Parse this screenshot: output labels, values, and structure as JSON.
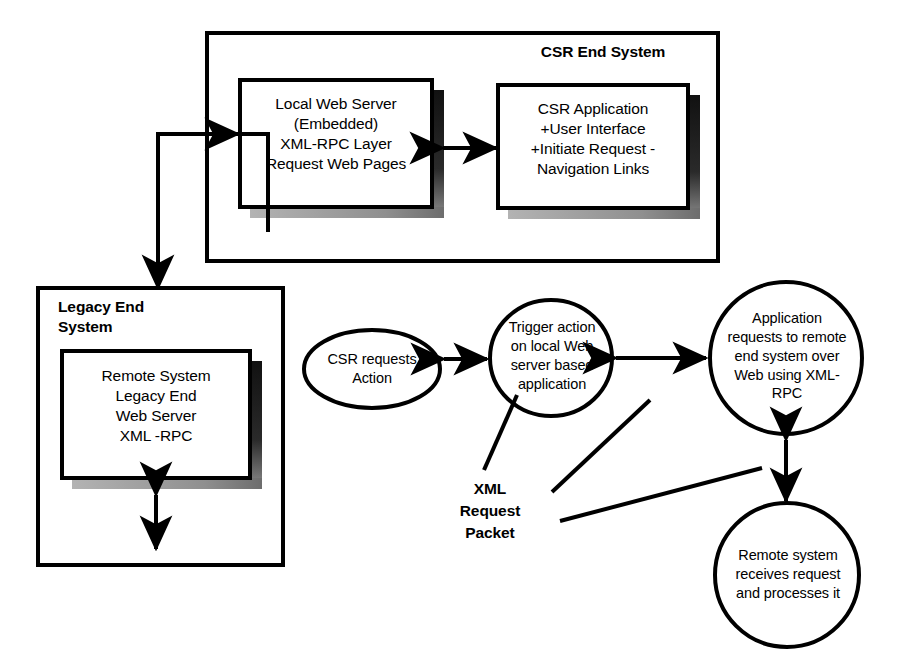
{
  "diagram": {
    "colors": {
      "stroke": "#000000",
      "fill": "#ffffff",
      "shadow_dark": "#1a1a1a",
      "shadow_light": "#9a9a9a"
    }
  },
  "csr_system": {
    "title": "CSR End System",
    "boxes": [
      {
        "id": "local-web-server",
        "text": "Local Web Server\n(Embedded)\nXML-RPC Layer\nRequest Web Pages"
      },
      {
        "id": "csr-application",
        "text": "CSR Application\n+User Interface\n+Initiate Request -\nNavigation Links"
      }
    ]
  },
  "legacy_system": {
    "title": "Legacy End\nSystem",
    "boxes": [
      {
        "id": "remote-system",
        "text": "Remote System\nLegacy End\nWeb Server\nXML -RPC"
      }
    ]
  },
  "flow_nodes": [
    {
      "id": "csr-requests-action",
      "shape": "ellipse",
      "text": "CSR requests\nAction"
    },
    {
      "id": "trigger-action",
      "shape": "ellipse",
      "text": "Trigger action\non local Web\nserver based\napplication"
    },
    {
      "id": "application-requests",
      "shape": "circle",
      "text": "Application\nrequests to remote\nend system over\nWeb using XML-\nRPC"
    },
    {
      "id": "remote-system-receives",
      "shape": "circle",
      "text": "Remote system\nreceives request\nand processes it"
    }
  ],
  "annotations": [
    {
      "id": "xml-request-packet",
      "text": "XML\nRequest\nPacket"
    }
  ]
}
